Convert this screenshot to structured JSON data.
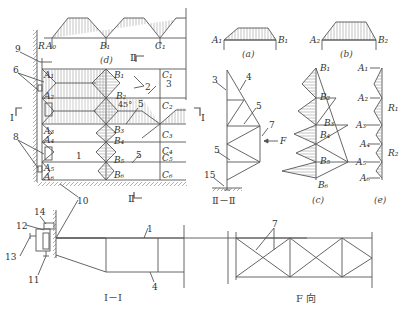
{
  "diagram": {
    "type": "structural engineering drawing — wind bracing system of a building/shed",
    "colors": {
      "line": "#555555",
      "hatch": "#888888",
      "background": "#ffffff"
    }
  },
  "plan": {
    "caption_d": "(d)",
    "top_nodes": [
      "A₀",
      "B₁",
      "C₁"
    ],
    "reaction": "R",
    "section_I": "Ⅰ",
    "section_II": "Ⅱ",
    "angle": "45°",
    "left_nodes": [
      "A₁",
      "A₂",
      "A₃",
      "A₄",
      "A₅",
      "A₆"
    ],
    "mid_nodes": [
      "B₁",
      "B₂",
      "B₃",
      "B₄",
      "B₅",
      "B₆"
    ],
    "right_nodes": [
      "C₁",
      "C₂",
      "C₃",
      "C₄",
      "C₅",
      "C₆"
    ],
    "center_label": "1",
    "callouts": [
      "9",
      "6",
      "8",
      "2",
      "3",
      "5",
      "5",
      "10"
    ]
  },
  "section_I_I": {
    "caption": "Ⅰ－Ⅰ",
    "callouts": [
      "14",
      "12",
      "13",
      "11",
      "1",
      "4"
    ]
  },
  "load_a": {
    "caption": "(a)",
    "left": "A₁",
    "right": "B₁"
  },
  "load_b": {
    "caption": "(b)",
    "left": "A₂",
    "right": "B₂"
  },
  "section_II_II": {
    "caption": "Ⅱ－Ⅱ",
    "callouts": [
      "3",
      "4",
      "5",
      "7",
      "5",
      "15"
    ],
    "force": "F"
  },
  "diagram_c": {
    "caption": "(c)",
    "nodes": [
      "B₁",
      "B₂",
      "B₃",
      "B₄",
      "B₅",
      "B₆"
    ]
  },
  "diagram_e": {
    "caption": "(e)",
    "nodes": [
      "A₁",
      "A₂",
      "A₃",
      "A₄",
      "A₅",
      "A₆"
    ],
    "reactions": [
      "R₁",
      "R₂"
    ]
  },
  "view_F": {
    "caption": "F 向",
    "callout": "7"
  }
}
